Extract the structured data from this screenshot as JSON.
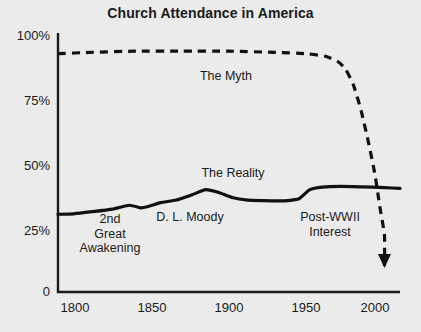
{
  "chart_data": {
    "type": "line",
    "title": "Church Attendance in America",
    "xlabel": "",
    "ylabel": "",
    "xlim": [
      1790,
      2010
    ],
    "ylim": [
      0,
      100
    ],
    "grid": false,
    "legend_position": "inline-annotations",
    "x_ticks": [
      "1800",
      "1850",
      "1900",
      "1950",
      "2000"
    ],
    "x_tick_values": [
      1800,
      1850,
      1900,
      1950,
      2000
    ],
    "y_ticks": [
      "100%",
      "75%",
      "50%",
      "25%",
      "0"
    ],
    "y_tick_values": [
      100,
      75,
      50,
      25,
      0
    ],
    "series": [
      {
        "name": "The Myth",
        "style": "dashed",
        "color": "#111111",
        "arrow_end": true,
        "x": [
          1790,
          1810,
          1840,
          1870,
          1900,
          1930,
          1950,
          1962,
          1970,
          1975,
          1980,
          1985,
          1990,
          1994,
          1997,
          2000,
          2000
        ],
        "values": [
          92,
          92.5,
          93,
          93,
          93,
          92.5,
          92,
          91,
          89,
          86,
          80,
          70,
          57,
          45,
          33,
          22,
          10
        ]
      },
      {
        "name": "The Reality",
        "style": "solid",
        "color": "#111111",
        "arrow_end": false,
        "x": [
          1790,
          1800,
          1812,
          1825,
          1836,
          1843,
          1848,
          1856,
          1866,
          1876,
          1885,
          1893,
          1902,
          1912,
          1922,
          1930,
          1938,
          1945,
          1952,
          1960,
          1972,
          1985,
          2000,
          2010
        ],
        "values": [
          30,
          30.2,
          31,
          32,
          33.5,
          32.5,
          33,
          34.5,
          35.5,
          37.5,
          39.5,
          38.5,
          36.5,
          35.5,
          35.3,
          35.2,
          35.3,
          36,
          39.5,
          40.5,
          40.8,
          40.6,
          40.3,
          40
        ]
      }
    ],
    "annotations": [
      {
        "text": "The Myth",
        "x_px": 226,
        "y_px": 76
      },
      {
        "text": "The Reality",
        "x_px": 233,
        "y_px": 173
      },
      {
        "text": "2nd\nGreat\nAwakening",
        "x_px": 110,
        "y_px": 225
      },
      {
        "text": "D. L. Moody",
        "x_px": 190,
        "y_px": 217
      },
      {
        "text": "Post-WWII\nInterest",
        "x_px": 330,
        "y_px": 217
      }
    ]
  },
  "colors": {
    "background": "#ebebeb",
    "ink": "#1a1a1a",
    "line": "#111111"
  }
}
